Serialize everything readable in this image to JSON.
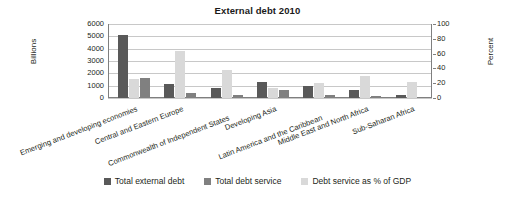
{
  "chart_data": {
    "type": "bar",
    "title": "External debt 2010",
    "xlabel": "",
    "ylabel": "Billions",
    "y2label": "Percent",
    "ylim": [
      0,
      6000
    ],
    "y2lim": [
      0,
      100
    ],
    "yticks": [
      "0",
      "1000",
      "2000",
      "3000",
      "4000",
      "5000",
      "6000"
    ],
    "y2ticks": [
      "0",
      "20",
      "40",
      "60",
      "80",
      "100"
    ],
    "grid": true,
    "legend_position": "bottom",
    "categories": [
      "Emerging and developing economies",
      "Central and Eastern Europe",
      "Commonwealth of Independent States",
      "Developing Asia",
      "Latin America and the Caribbean",
      "Middle East and North Africa",
      "Sub-Saharan Africa"
    ],
    "series": [
      {
        "name": "Total external debt",
        "axis": "left",
        "color": "#595959",
        "values": [
          5100,
          1120,
          800,
          1260,
          1010,
          680,
          240
        ]
      },
      {
        "name": "Total debt service",
        "axis": "left",
        "color": "#808080",
        "values": [
          1650,
          370,
          250,
          660,
          270,
          150,
          60
        ]
      },
      {
        "name": "Debt service as % of GDP",
        "axis": "right",
        "color": "#d9d9d9",
        "values": [
          26,
          64,
          38,
          13,
          20,
          30,
          21
        ]
      }
    ]
  },
  "legend": {
    "items": [
      {
        "label": "Total external debt",
        "color": "#595959"
      },
      {
        "label": "Total debt service",
        "color": "#808080"
      },
      {
        "label": "Debt service as % of GDP",
        "color": "#d9d9d9"
      }
    ]
  }
}
